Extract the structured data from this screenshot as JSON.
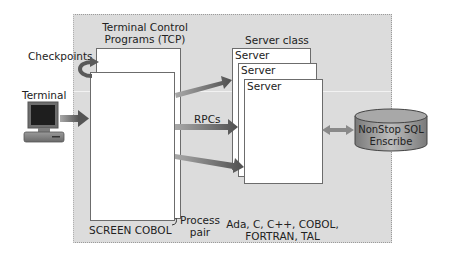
{
  "diagram": {
    "tcp_title": [
      "Terminal Control",
      "Programs (TCP)"
    ],
    "checkpoints_label": "Checkpoints",
    "terminal_label": "Terminal",
    "rpcs_label": "RPCs",
    "server_class_label": "Server class",
    "servers": [
      "Server",
      "Server",
      "Server"
    ],
    "database_label": [
      "NonStop SQL",
      "Enscribe"
    ],
    "screen_cobol_label": "SCREEN COBOL",
    "process_pair_label": [
      "Process",
      "pair"
    ],
    "languages_label": [
      "Ada, C, C++, COBOL,",
      "FORTRAN, TAL"
    ],
    "icons": {
      "terminal": "terminal-computer-icon",
      "checkpoint": "curved-arrow-icon",
      "database": "database-cylinder-icon"
    },
    "colors": {
      "panel_bg": "#dcdcdc",
      "arrow": "#6b6b6b",
      "box_border": "#6c6c6c"
    }
  }
}
